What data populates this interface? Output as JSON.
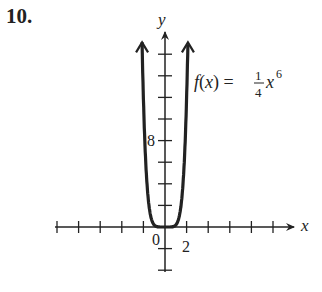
{
  "problem_number": "10.",
  "axes": {
    "x_label": "x",
    "y_label": "y",
    "origin_label": "0",
    "x_tick_label": "2",
    "y_tick_label": "8"
  },
  "function_label": {
    "prefix": "f(x) = ",
    "numerator": "1",
    "denominator": "4",
    "base": "x",
    "exponent": "6"
  },
  "chart_data": {
    "type": "line",
    "xlabel": "x",
    "ylabel": "y",
    "x_tick_step": 2,
    "y_tick_step": 2,
    "xlim": [
      -10,
      12
    ],
    "ylim": [
      -4,
      16
    ],
    "labeled_ticks": {
      "x": [
        0,
        2
      ],
      "y": [
        8
      ]
    },
    "series": [
      {
        "name": "f(x) = 1/4 x^6",
        "x": [
          -1.9,
          -1.5,
          -1,
          -0.5,
          0,
          0.5,
          1,
          1.5,
          1.9
        ],
        "y": [
          11.76,
          2.85,
          0.25,
          0.004,
          0,
          0.004,
          0.25,
          2.85,
          11.76
        ]
      }
    ],
    "grid": false
  }
}
